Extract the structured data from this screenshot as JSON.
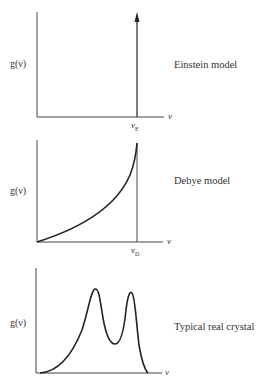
{
  "panels": [
    {
      "title": "Einstein model",
      "y_label": "g(ν)",
      "x_label": "ν",
      "marker_label": "ν",
      "marker_sub": "E",
      "curve": "delta spike with arrow at ν_E"
    },
    {
      "title": "Debye model",
      "y_label": "g(ν)",
      "x_label": "ν",
      "marker_label": "ν",
      "marker_sub": "D",
      "curve": "quadratic rise ending at cutoff ν_D"
    },
    {
      "title": "Typical real crystal",
      "y_label": "g(ν)",
      "x_label": "ν",
      "curve": "two-peak spectrum"
    }
  ],
  "colors": {
    "line": "#222222",
    "axis": "#555555",
    "background": "#ffffff"
  }
}
